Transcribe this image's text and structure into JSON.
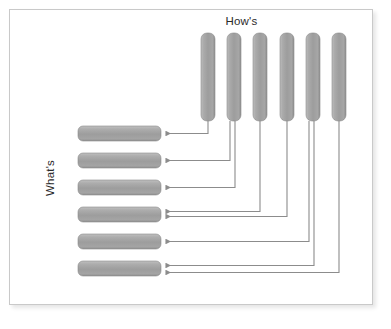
{
  "figure": {
    "type": "matrix-relationship-diagram",
    "background_color": "#ffffff",
    "frame_color": "#c9c9c9",
    "bar_color": "#a3a3a3",
    "connector_color": "#8c8c8c"
  },
  "labels": {
    "hows": "How's",
    "whats": "What's"
  },
  "hows_bars": [
    {
      "id": "how-1",
      "index": 1
    },
    {
      "id": "how-2",
      "index": 2
    },
    {
      "id": "how-3",
      "index": 3
    },
    {
      "id": "how-4",
      "index": 4
    },
    {
      "id": "how-5",
      "index": 5
    },
    {
      "id": "how-6",
      "index": 6
    }
  ],
  "whats_bars": [
    {
      "id": "what-1",
      "index": 1
    },
    {
      "id": "what-2",
      "index": 2
    },
    {
      "id": "what-3",
      "index": 3
    },
    {
      "id": "what-4",
      "index": 4
    },
    {
      "id": "what-5",
      "index": 5
    },
    {
      "id": "what-6",
      "index": 6
    }
  ],
  "connections": [
    {
      "from": "how-1",
      "to": "what-1"
    },
    {
      "from": "how-2",
      "to": "what-2"
    },
    {
      "from": "how-2",
      "to": "what-3"
    },
    {
      "from": "how-3",
      "to": "what-4"
    },
    {
      "from": "how-4",
      "to": "what-4"
    },
    {
      "from": "how-5",
      "to": "what-5"
    },
    {
      "from": "how-5",
      "to": "what-6"
    },
    {
      "from": "how-6",
      "to": "what-6"
    }
  ],
  "geometry": {
    "how_bar_top": 33,
    "how_bar_bottom": 121,
    "how_bar_width": 14,
    "how_bar_x": [
      201,
      227,
      253,
      280,
      306,
      332
    ],
    "what_bar_left": 78,
    "what_bar_right": 161,
    "what_bar_height": 15,
    "what_bar_y": [
      126,
      153,
      180,
      207,
      234,
      261
    ]
  }
}
